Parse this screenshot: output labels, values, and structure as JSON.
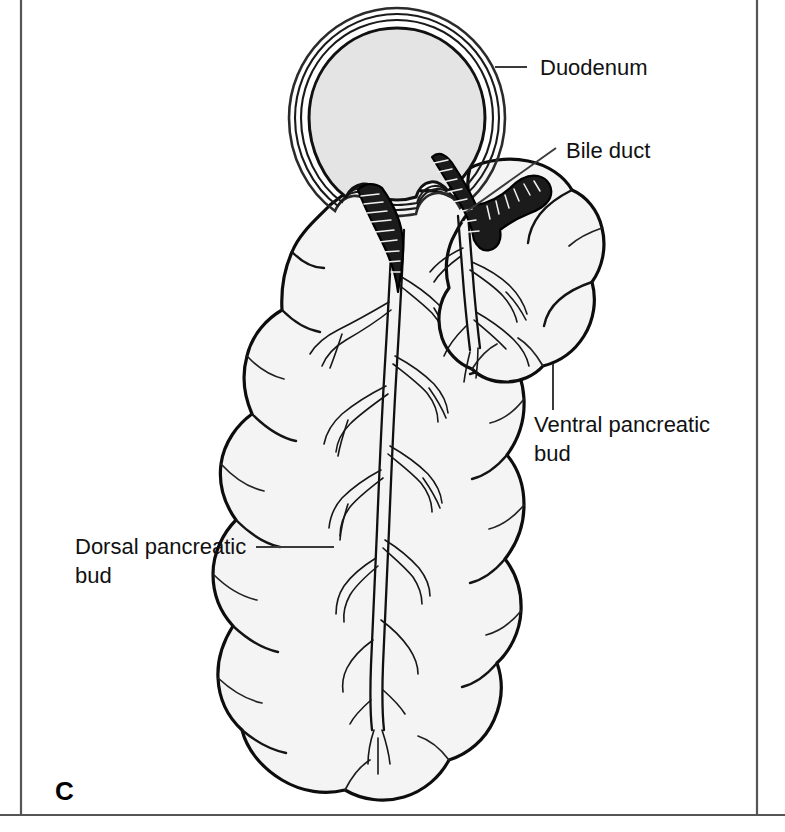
{
  "figure": {
    "panel_letter": "C",
    "title_visible": false,
    "background_color": "#ffffff",
    "frame_color": "#555555"
  },
  "labels": [
    {
      "id": "duodenum",
      "text": "Duodenum",
      "x": 540,
      "y": 75,
      "anchor": "start",
      "leader": {
        "type": "line",
        "x1": 495,
        "y1": 67,
        "x2": 527,
        "y2": 67
      }
    },
    {
      "id": "bile-duct",
      "text": "Bile duct",
      "x": 566,
      "y": 158,
      "anchor": "start",
      "leader": {
        "type": "line",
        "x1": 466,
        "y1": 212,
        "x2": 556,
        "y2": 148
      }
    },
    {
      "id": "ventral-pancreatic-bud",
      "text_line1": "Ventral pancreatic",
      "text_line2": "bud",
      "x": 534,
      "y": 432,
      "anchor": "start",
      "leader": {
        "type": "line",
        "x1": 553,
        "y1": 364,
        "x2": 553,
        "y2": 410
      }
    },
    {
      "id": "dorsal-pancreatic-bud",
      "text_line1": "Dorsal pancreatic",
      "text_line2": "bud",
      "x": 75,
      "y": 554,
      "anchor": "start",
      "leader": {
        "type": "line",
        "x1": 256,
        "y1": 547,
        "x2": 334,
        "y2": 547
      }
    }
  ],
  "structures": [
    {
      "id": "duodenum",
      "name": "Duodenum",
      "kind": "circular-cross-section",
      "fill": "#e4e4e4",
      "center_x": 397,
      "center_y": 118,
      "radius": 108
    },
    {
      "id": "dorsal-bud",
      "name": "Dorsal pancreatic bud",
      "kind": "lobulated-organ",
      "fill": "#f4f4f4"
    },
    {
      "id": "ventral-bud",
      "name": "Ventral pancreatic bud",
      "kind": "lobulated-organ",
      "fill": "#f4f4f4"
    },
    {
      "id": "bile-duct",
      "name": "Bile duct",
      "kind": "striated-tube",
      "fill": "#1b1b1b"
    },
    {
      "id": "dorsal-duct",
      "name": "Dorsal pancreatic duct",
      "kind": "branching-duct",
      "fill": "none"
    }
  ],
  "colors": {
    "organ_fill": "#f4f4f4",
    "duodenum_fill": "#e4e4e4",
    "outline": "#0d0d0d",
    "label_text": "#111111",
    "leader": "#3a3a3a"
  }
}
